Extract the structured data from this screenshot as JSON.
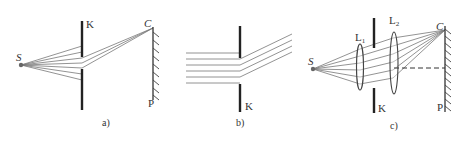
{
  "figure": {
    "panels": [
      {
        "id": "a",
        "caption": "a)",
        "labels": {
          "source": "S",
          "screen_k": "K",
          "point": "C",
          "screen_p": "P"
        },
        "description": "Point source S emits diverging rays through slit in screen K; light converges at point C on screen P"
      },
      {
        "id": "b",
        "caption": "b)",
        "labels": {
          "screen_k": "K"
        },
        "description": "Parallel beam passes through slit in screen K and continues as parallel rays bent upward"
      },
      {
        "id": "c",
        "caption": "c)",
        "labels": {
          "source": "S",
          "lens1": "L",
          "lens1_sub": "1",
          "lens2": "L",
          "lens2_sub": "2",
          "screen_k": "K",
          "point": "C",
          "screen_p": "P"
        },
        "description": "Source S, lens L1 makes rays parallel, slit K, lens L2 focuses rays to point C on screen P; dashed line is optical axis of L2"
      }
    ],
    "colors": {
      "ray": "#777777",
      "barrier": "#222222",
      "text": "#333333",
      "background": "#ffffff"
    }
  }
}
